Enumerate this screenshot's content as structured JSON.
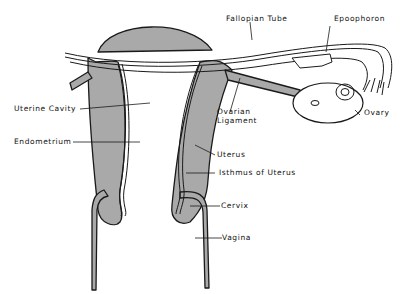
{
  "diagram": {
    "colors": {
      "tissue": "#a9a9a9",
      "outline": "#1a1a1a",
      "background": "#ffffff"
    },
    "labels": {
      "fallopian_tube": "Fallopian Tube",
      "epoophoron": "Epoophoron",
      "uterine_cavity": "Uterine Cavity",
      "ovarian_ligament_1": "Ovarian",
      "ovarian_ligament_2": "Ligament",
      "ovary": "Ovary",
      "endometrium": "Endometrium",
      "uterus": "Uterus",
      "isthmus": "Isthmus of Uterus",
      "cervix": "Cervix",
      "vagina": "Vagina"
    }
  }
}
